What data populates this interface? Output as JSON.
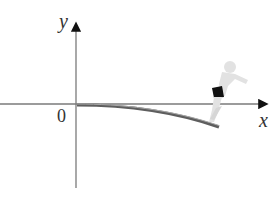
{
  "diagram": {
    "axes": {
      "x_label": "x",
      "y_label": "y",
      "origin_label": "0"
    },
    "elements": [
      {
        "name": "diving-board",
        "description": "curved diving board bending downward from origin"
      },
      {
        "name": "diver",
        "description": "diver in black swim trunks standing at board end, crouched to jump"
      }
    ],
    "colors": {
      "axis": "#7a7a7a",
      "board": "#6b6b6b",
      "diver_body": "#e2e2e2",
      "trunks": "#111111"
    }
  }
}
